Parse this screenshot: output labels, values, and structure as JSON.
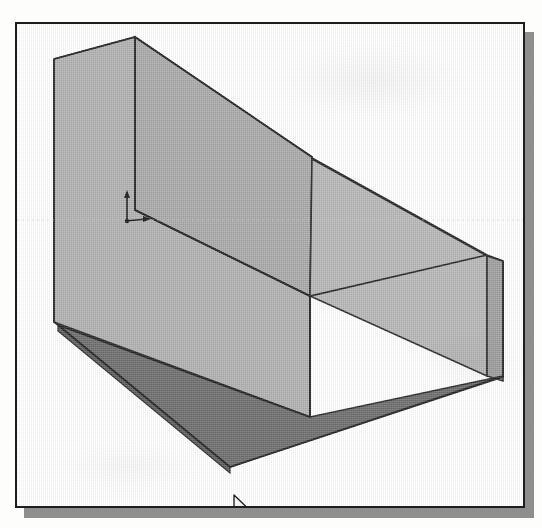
{
  "app": {
    "view_title": "3D Model Viewport",
    "render_mode": "shaded-solid",
    "background_color": "#ffffff",
    "frame_border_color": "#1d1d1d",
    "shadow_color": "#8e8e8e"
  },
  "viewport": {
    "frame": {
      "x": 15,
      "y": 22,
      "width": 510,
      "height": 486
    },
    "shadow_offset": {
      "x": 9,
      "y": 10
    }
  },
  "model": {
    "name": "wedge-ramp-solid",
    "description": "Inclined wedge / ramp block shown in isometric shaded view",
    "edge_color": "#2a2a2a",
    "faces": [
      {
        "name": "left-vertical-face",
        "shade": "#b0b0b0",
        "points": "37,35 118,13 118,186 293,272 293,393 37,298"
      },
      {
        "name": "top-sloped-face",
        "shade": "#a8a8a8",
        "points": "118,13 295,133 293,272 118,186"
      },
      {
        "name": "ridge-right-upper-face",
        "shade": "#b4b4b4",
        "points": "295,133 295,135 470,230 470,232"
      },
      {
        "name": "right-wall-face",
        "shade": "#b6b6b6",
        "points": "295,135 470,232 470,352 293,272"
      },
      {
        "name": "right-outer-face",
        "shade": "#9e9e9e",
        "points": "470,232 486,237 486,357 470,352"
      },
      {
        "name": "floor-face",
        "shade": "#6d6d6d",
        "points": "41,301 293,393 486,352 213,443"
      },
      {
        "name": "floor-front-edge-band",
        "shade": "#5d5d5d",
        "points": "41,301 213,443 213,449 41,307"
      }
    ]
  },
  "origin_marker": {
    "name": "origin-axis-indicator",
    "y_axis_label": "",
    "x_axis_label": "",
    "color": "#1a1a1a"
  },
  "cursor": {
    "type": "arrow-pointer",
    "x": 215,
    "y": 470,
    "fill": "#f2f2f2",
    "stroke": "#1a1a1a"
  }
}
